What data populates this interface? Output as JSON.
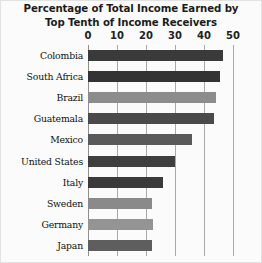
{
  "chart_data": {
    "type": "bar",
    "orientation": "horizontal",
    "title": "Percentage of Total Income Earned by Top Tenth of Income Receivers",
    "title_lines": [
      "Percentage of Total Income Earned by",
      "Top Tenth of Income Receivers"
    ],
    "xlabel": "",
    "ylabel": "",
    "xlim": [
      0,
      50
    ],
    "xticks": [
      0,
      10,
      20,
      30,
      40,
      50
    ],
    "xtick_labels": [
      "0",
      "10",
      "20",
      "30",
      "40",
      "50"
    ],
    "grid": true,
    "grid_axis": "x",
    "legend": false,
    "categories": [
      "Colombia",
      "South Africa",
      "Brazil",
      "Guatemala",
      "Mexico",
      "United States",
      "Italy",
      "Sweden",
      "Germany",
      "Japan"
    ],
    "values": [
      46.5,
      45.5,
      44.0,
      43.5,
      36.0,
      30.0,
      26.0,
      22.0,
      22.5,
      22.0
    ],
    "bar_colors": [
      "#3a3a3a",
      "#333333",
      "#8c8c8c",
      "#4a4a4a",
      "#5a5a5a",
      "#3f3f3f",
      "#3a3a3a",
      "#8a8a8a",
      "#949494",
      "#5e5e5e"
    ],
    "series": [
      {
        "name": "Percentage of total income earned by top tenth",
        "values": [
          46.5,
          45.5,
          44.0,
          43.5,
          36.0,
          30.0,
          26.0,
          22.0,
          22.5,
          22.0
        ]
      }
    ]
  },
  "colors": {
    "background": "#fbfbfb",
    "gridline": "#a9a9a9",
    "title_text": "#1b1b1b",
    "label_text": "#101010"
  }
}
